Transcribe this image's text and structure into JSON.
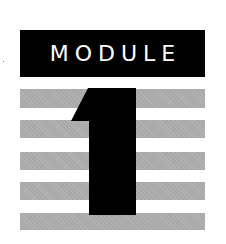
{
  "label": {
    "text": "MODULE"
  },
  "numeral": {
    "value": "1",
    "color": "#000000"
  },
  "stripes": {
    "color": "#a9a9a9",
    "count": 5
  },
  "colors": {
    "background": "#ffffff",
    "label_bg": "#000000",
    "label_fg": "#ffffff"
  }
}
